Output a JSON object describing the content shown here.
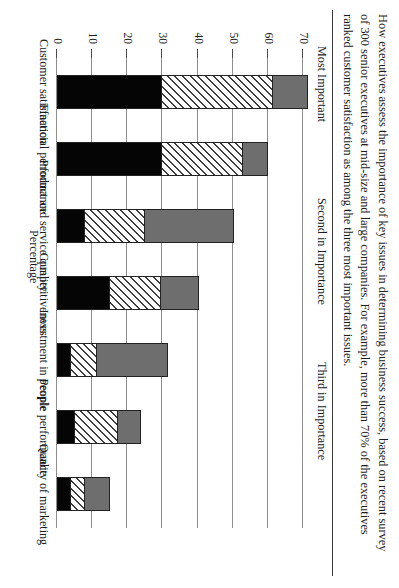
{
  "caption": {
    "lines": [
      "How executives assess the importance of key issues in determining business success, based on recent survey",
      "of 300 senior executives at mid-size and large companies. For example, more than 70% of the executives",
      "ranked customer satisfaction as among the three most important issues."
    ]
  },
  "chart_data": {
    "type": "bar",
    "subtype": "stacked-bar",
    "title": "",
    "xlabel": "",
    "ylabel": "Percentage",
    "ylim": [
      0,
      70
    ],
    "yticks": [
      "0",
      "10",
      "20",
      "30",
      "40",
      "50",
      "60",
      "70"
    ],
    "grid": true,
    "legend_position": "top",
    "categories": [
      "Customer satisfaction",
      "Financial performance",
      "Product and service quality",
      "Competitiveness",
      "Investment in people",
      "People performance",
      "Quality of marketing"
    ],
    "series": [
      {
        "name": "Most Important",
        "fill": "solid-black",
        "color": "#050505",
        "values": [
          30,
          30,
          8,
          15,
          4,
          5,
          4
        ]
      },
      {
        "name": "Second in Importance",
        "fill": "diagonal-hatch",
        "color": "#ffffff",
        "values": [
          31.5,
          23,
          17,
          14.5,
          7.5,
          12.5,
          4
        ]
      },
      {
        "name": "Third in Importance",
        "fill": "solid-gray",
        "color": "#6e6e6e",
        "values": [
          10,
          7,
          25.5,
          11,
          20,
          6.5,
          7
        ]
      }
    ],
    "totals": [
      71.5,
      60,
      50.5,
      40.5,
      31.5,
      24,
      15
    ]
  }
}
